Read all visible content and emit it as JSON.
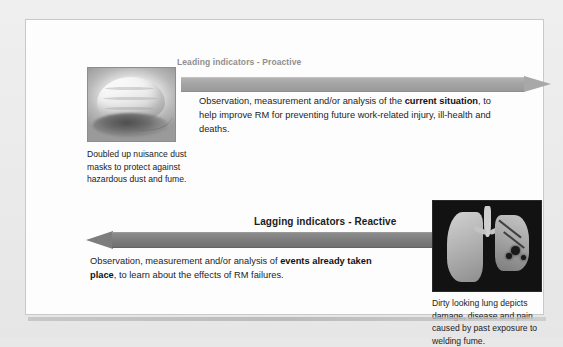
{
  "figure": {
    "name": "leading-and-lagging-indicators-diagram",
    "background_color": "#ececec",
    "panel_color": "#fdfdfd"
  },
  "leading": {
    "label": "Leading indicators - Proactive",
    "label_color": "#8f8f8f",
    "arrow_direction": "right",
    "arrow_color": "#a5a5a5",
    "text_parts": [
      {
        "text": "Observation, measurement and/or analysis of the ",
        "bold": false
      },
      {
        "text": "current situation",
        "bold": true
      },
      {
        "text": ", to help improve RM for preventing future work-related injury, ill-health and deaths.",
        "bold": false
      }
    ],
    "text_plain": "Observation, measurement and/or analysis of the current situation, to help improve RM for preventing future work-related injury, ill-health and deaths."
  },
  "lagging": {
    "label": "Lagging indicators - Reactive",
    "label_color": "#1b1b1b",
    "arrow_direction": "left",
    "arrow_color": "#7e7e7e",
    "text_parts": [
      {
        "text": "Observation, measurement and/or analysis of ",
        "bold": false
      },
      {
        "text": "events already taken place",
        "bold": true
      },
      {
        "text": ", to learn about the effects of RM failures.",
        "bold": false
      }
    ],
    "text_plain": "Observation, measurement and/or analysis of events already taken place, to learn about the effects of RM failures."
  },
  "photos": [
    {
      "id": "dust-mask-photo",
      "subject": "doubled up nuisance dust masks",
      "style": "grayscale-photograph",
      "caption": "Doubled up nuisance dust masks to protect against hazardous dust and fume."
    },
    {
      "id": "lung-photo",
      "subject": "dirty looking diseased lung",
      "style": "grayscale-photograph-dark-background",
      "caption": "Dirty looking lung depicts damage, disease and pain caused by past exposure to welding fume."
    }
  ]
}
